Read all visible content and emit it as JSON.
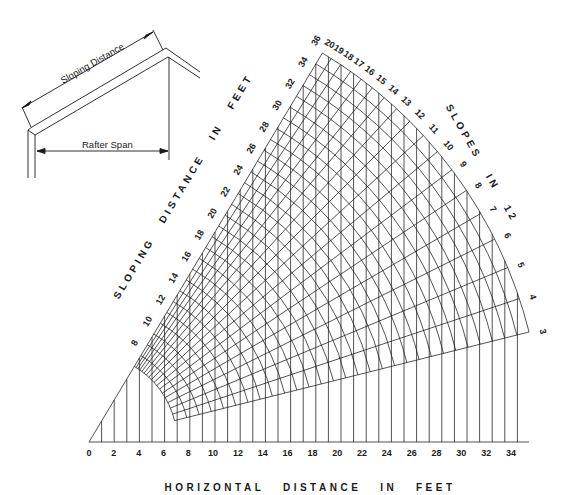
{
  "inset": {
    "sloping_label": "Sloping Distance",
    "span_label": "Rafter Span"
  },
  "axes": {
    "x_title": "HORIZONTAL   DISTANCE   IN   FEET",
    "slope_title": "SLOPING   DISTANCE   IN   FEET",
    "pitch_title": "SLOPES   IN   12"
  },
  "chart_data": {
    "type": "nomogram",
    "xlabel": "HORIZONTAL DISTANCE IN FEET",
    "x_ticks": [
      0,
      2,
      4,
      6,
      8,
      10,
      12,
      14,
      16,
      18,
      20,
      22,
      24,
      26,
      28,
      30,
      32,
      34
    ],
    "sloping_distance_label": "SLOPING DISTANCE IN FEET",
    "sloping_ticks": [
      8,
      10,
      12,
      14,
      16,
      18,
      20,
      22,
      24,
      26,
      28,
      30,
      32,
      34,
      36
    ],
    "slope_label": "SLOPES IN 12",
    "slopes": [
      3,
      4,
      5,
      6,
      7,
      8,
      9,
      10,
      11,
      12,
      13,
      14,
      15,
      16,
      17,
      18,
      19,
      20
    ],
    "radius_range_ft": [
      7,
      36
    ],
    "vertical_line_spacing_ft": 1,
    "grid": true
  },
  "style": {
    "ink": "#1a1a1a",
    "background": "#ffffff"
  }
}
